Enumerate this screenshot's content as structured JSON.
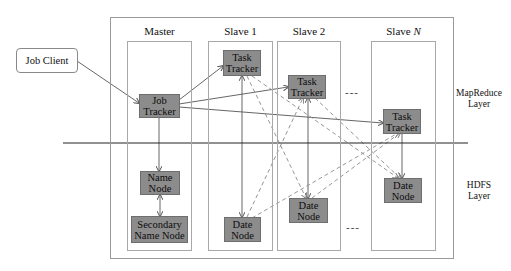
{
  "diagram": {
    "title": "",
    "client": {
      "label": "Job Client"
    },
    "columns": [
      {
        "id": "master",
        "label": "Master"
      },
      {
        "id": "slave1",
        "label": "Slave 1"
      },
      {
        "id": "slave2",
        "label": "Slave 2"
      },
      {
        "id": "slaveN",
        "label_prefix": "Slave ",
        "label_var": "N"
      }
    ],
    "nodes": {
      "job_tracker": {
        "line1": "Job",
        "line2": "Tracker"
      },
      "name_node": {
        "line1": "Name",
        "line2": "Node"
      },
      "secondary_name_node": {
        "line1": "Secondary",
        "line2": "Name Node"
      },
      "task_tracker_1": {
        "line1": "Task",
        "line2": "Tracker"
      },
      "task_tracker_2": {
        "line1": "Task",
        "line2": "Tracker"
      },
      "task_tracker_n": {
        "line1": "Task",
        "line2": "Tracker"
      },
      "data_node_1": {
        "line1": "Date",
        "line2": "Node"
      },
      "data_node_2": {
        "line1": "Date",
        "line2": "Node"
      },
      "data_node_n": {
        "line1": "Date",
        "line2": "Node"
      }
    },
    "layers": {
      "mapreduce": {
        "line1": "MapReduce",
        "line2": "Layer"
      },
      "hdfs": {
        "line1": "HDFS",
        "line2": "Layer"
      }
    },
    "ellipsis": "---",
    "colors": {
      "node_fill": "#8c8c8c",
      "node_border": "#6e6e6e",
      "frame_border": "#9a9a9a",
      "line": "#555555",
      "dashed_line": "#8a8a8a",
      "divider": "#222222"
    },
    "edges": [
      {
        "from": "Job Client",
        "to": "Job Tracker",
        "style": "solid"
      },
      {
        "from": "Job Tracker",
        "to": "Task Tracker (Slave 1)",
        "style": "solid"
      },
      {
        "from": "Job Tracker",
        "to": "Task Tracker (Slave 2)",
        "style": "solid"
      },
      {
        "from": "Job Tracker",
        "to": "Task Tracker (Slave N)",
        "style": "solid"
      },
      {
        "from": "Job Tracker",
        "to": "Name Node",
        "style": "solid"
      },
      {
        "from": "Name Node",
        "to": "Secondary Name Node",
        "style": "solid-bidirectional"
      },
      {
        "from": "Task Tracker (Slave 1)",
        "to": "Date Node (Slave 1)",
        "style": "solid"
      },
      {
        "from": "Task Tracker (Slave 2)",
        "to": "Date Node (Slave 2)",
        "style": "solid"
      },
      {
        "from": "Task Tracker (Slave N)",
        "to": "Date Node (Slave N)",
        "style": "solid"
      },
      {
        "from": "Task Tracker (Slave 1)",
        "to": "Date Node (Slave 2)",
        "style": "dashed"
      },
      {
        "from": "Task Tracker (Slave 1)",
        "to": "Date Node (Slave N)",
        "style": "dashed"
      },
      {
        "from": "Task Tracker (Slave 2)",
        "to": "Date Node (Slave N)",
        "style": "dashed"
      },
      {
        "from": "Date Node (Slave 1)",
        "to": "Task Tracker (Slave 2)",
        "style": "dashed"
      },
      {
        "from": "Date Node (Slave 1)",
        "to": "Task Tracker (Slave N)",
        "style": "dashed"
      },
      {
        "from": "Date Node (Slave 2)",
        "to": "Task Tracker (Slave N)",
        "style": "dashed"
      }
    ]
  }
}
